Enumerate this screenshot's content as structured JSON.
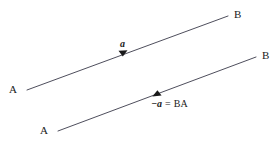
{
  "figure": {
    "background_color": "#ffffff",
    "stroke_color": "#3a3a4a",
    "text_color": "#1a1a1a"
  },
  "vectors": [
    {
      "id": "vector-ab",
      "tail_label": "A",
      "head_label": "B",
      "name_label": "a",
      "direction": "right",
      "tail": {
        "x": 27,
        "y": 90
      },
      "head": {
        "x": 228,
        "y": 16
      },
      "arrowhead": {
        "x": 124,
        "y": 52
      }
    },
    {
      "id": "vector-ba",
      "tail_label": "A",
      "head_label": "B",
      "direction": "left",
      "tail": {
        "x": 58,
        "y": 131
      },
      "head": {
        "x": 256,
        "y": 57
      },
      "arrowhead": {
        "x": 157,
        "y": 94
      }
    }
  ],
  "labels": {
    "line1_A": "A",
    "line1_B": "B",
    "line1_vector": "a",
    "line2_A": "A",
    "line2_B": "B"
  },
  "equation": {
    "negative_a": "−a",
    "equals": "=",
    "vector_ba": "BA"
  }
}
